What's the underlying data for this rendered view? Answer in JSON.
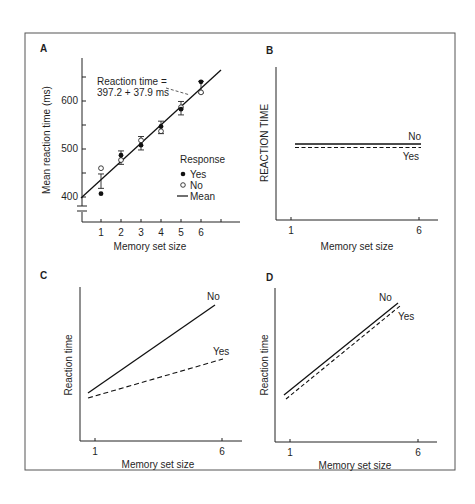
{
  "figure": {
    "frame_color": "#555555",
    "ink_color": "#1f1f1f"
  },
  "chart_data": [
    {
      "panel": "A",
      "type": "scatter",
      "title": "",
      "xlabel": "Memory set size",
      "ylabel": "Mean reaction time (ms)",
      "x_ticks": [
        "1",
        "2",
        "3",
        "4",
        "5",
        "6"
      ],
      "y_ticks": [
        "400",
        "500",
        "600"
      ],
      "ylim": [
        400,
        650
      ],
      "axis_break": true,
      "annotation": [
        "Reaction time =",
        "397.2 + 37.9 ms"
      ],
      "legend": {
        "title": "Response",
        "entries": [
          {
            "label": "Yes",
            "marker": "filled-circle"
          },
          {
            "label": "No",
            "marker": "open-circle"
          },
          {
            "label": "Mean",
            "marker": "line"
          }
        ]
      },
      "x": [
        1,
        2,
        3,
        4,
        5,
        6
      ],
      "series": [
        {
          "name": "Yes",
          "values": [
            407,
            487,
            508,
            547,
            583,
            640
          ]
        },
        {
          "name": "No",
          "values": [
            460,
            477,
            518,
            537,
            587,
            618
          ]
        },
        {
          "name": "Mean",
          "values": [
            433,
            482,
            512,
            545,
            585,
            629
          ],
          "error": [
            15,
            14,
            14,
            13,
            14,
            12
          ]
        }
      ],
      "fit_line": {
        "intercept": 397.2,
        "slope": 37.9
      }
    },
    {
      "panel": "B",
      "type": "line",
      "xlabel": "Memory set size",
      "ylabel": "REACTION TIME",
      "x_ticks": [
        "1",
        "6"
      ],
      "series": [
        {
          "name": "No",
          "style": "solid",
          "values": [
            0.5,
            0.5
          ]
        },
        {
          "name": "Yes",
          "style": "dashed",
          "values": [
            0.48,
            0.48
          ]
        }
      ]
    },
    {
      "panel": "C",
      "type": "line",
      "xlabel": "Memory set size",
      "ylabel": "Reaction time",
      "x_ticks": [
        "1",
        "6"
      ],
      "series": [
        {
          "name": "No",
          "style": "solid",
          "values": [
            0.3,
            0.88
          ]
        },
        {
          "name": "Yes",
          "style": "dashed",
          "values": [
            0.28,
            0.53
          ]
        }
      ]
    },
    {
      "panel": "D",
      "type": "line",
      "xlabel": "Memory set size",
      "ylabel": "Reaction time",
      "x_ticks": [
        "1",
        "6"
      ],
      "series": [
        {
          "name": "No",
          "style": "solid",
          "values": [
            0.3,
            0.89
          ]
        },
        {
          "name": "Yes",
          "style": "dashed",
          "values": [
            0.28,
            0.87
          ]
        }
      ]
    }
  ]
}
